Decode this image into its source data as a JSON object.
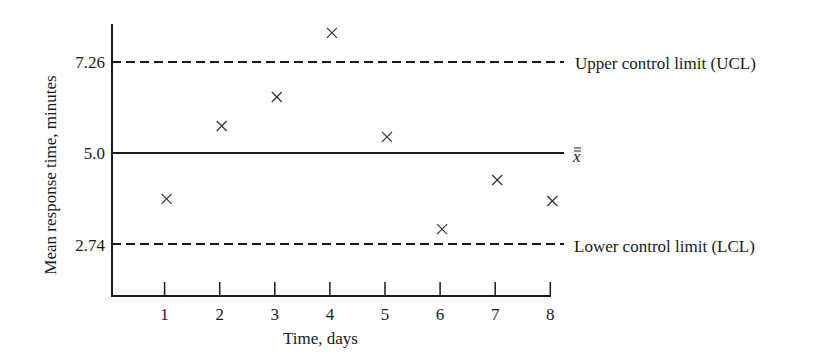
{
  "chart_data": {
    "type": "scatter",
    "title": "",
    "xlabel": "Time, days",
    "ylabel": "Mean response time, minutes",
    "x": [
      1,
      2,
      3,
      4,
      5,
      6,
      7,
      8
    ],
    "series": [
      {
        "name": "Daily mean response time",
        "marker": "x",
        "values": [
          3.86,
          5.67,
          6.39,
          7.98,
          5.4,
          3.11,
          4.33,
          3.81
        ]
      }
    ],
    "reference_lines": [
      {
        "name": "Upper control limit (UCL)",
        "value": 7.26,
        "style": "dashed"
      },
      {
        "name": "x-double-bar",
        "label": "x̿",
        "value": 5.0,
        "style": "solid"
      },
      {
        "name": "Lower control limit (LCL)",
        "value": 2.74,
        "style": "dashed"
      }
    ],
    "x_ticks": [
      "1",
      "2",
      "3",
      "4",
      "5",
      "6",
      "7",
      "8"
    ],
    "y_ticks": [
      "7.26",
      "5.0",
      "2.74"
    ],
    "xlim": [
      0,
      8
    ],
    "ylim": [
      1.5,
      8.5
    ],
    "grid": false,
    "legend": "inline labels at right of reference lines"
  },
  "labels": {
    "ucl": "Upper control limit (UCL)",
    "center": "x",
    "lcl": "Lower control limit (LCL)",
    "xlabel": "Time, days",
    "ylabel": "Mean response time, minutes",
    "y_ucl": "7.26",
    "y_center": "5.0",
    "y_lcl": "2.74"
  }
}
